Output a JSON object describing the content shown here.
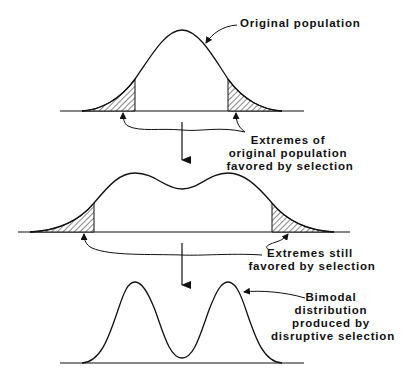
{
  "diagram": {
    "type": "disruptive-selection-distributions",
    "stages": [
      {
        "id": "original",
        "shape": "unimodal",
        "shaded_tails": true
      },
      {
        "id": "intermediate",
        "shape": "flattened-bimodal",
        "shaded_tails": true
      },
      {
        "id": "final",
        "shape": "bimodal",
        "shaded_tails": false
      }
    ],
    "labels": {
      "original_population": "Original population",
      "extremes_original": [
        "Extremes of",
        "original population",
        "favored by selection"
      ],
      "extremes_still": [
        "Extremes still",
        "favored by selection"
      ],
      "bimodal": [
        "Bimodal",
        "distribution",
        "produced by",
        "disruptive selection"
      ]
    },
    "arrows": [
      "down-arrow-1",
      "down-arrow-2"
    ],
    "colors": {
      "ink": "#111111",
      "background": "#ffffff"
    }
  }
}
